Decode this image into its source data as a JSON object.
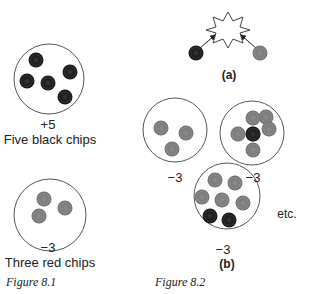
{
  "figure_8_1": {
    "caption": "Figure 8.1",
    "panels": [
      {
        "value": "+5",
        "label": "Five black chips",
        "chips": {
          "black": 5,
          "red": 0
        }
      },
      {
        "value": "−3",
        "label": "Three red chips",
        "chips": {
          "black": 0,
          "red": 3
        }
      }
    ]
  },
  "figure_8_2": {
    "caption": "Figure 8.2",
    "part_a": {
      "label": "(a)",
      "description": "black chip and red chip colliding (annihilate)"
    },
    "part_b": {
      "label": "(b)",
      "panels": [
        {
          "value": "−3",
          "chips": {
            "black": 0,
            "red": 3
          }
        },
        {
          "value": "−3",
          "chips": {
            "black": 1,
            "red": 4
          }
        },
        {
          "value": "−3",
          "chips": {
            "black": 2,
            "red": 5
          }
        }
      ],
      "etc": "etc."
    }
  },
  "colors": {
    "black_chip": "#151515",
    "red_chip": "#7a7a7a",
    "circle_stroke": "#555555"
  }
}
